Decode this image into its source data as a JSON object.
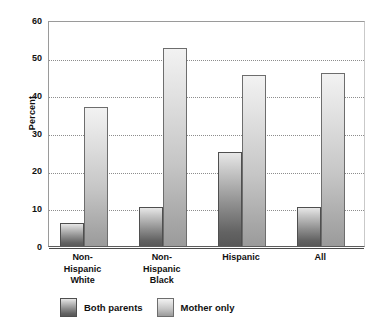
{
  "chart_data": {
    "type": "bar",
    "title": "",
    "subtitle": "",
    "xlabel": "",
    "ylabel": "Percent",
    "ylim": [
      0,
      60
    ],
    "yticks": [
      0,
      10,
      20,
      30,
      40,
      50,
      60
    ],
    "ytick_labels": [
      "0",
      "10",
      "20",
      "30",
      "40",
      "50",
      "60"
    ],
    "grid": true,
    "grid_axis": "y",
    "grid_style": "dotted",
    "legend_position": "bottom-left",
    "categories": [
      "Non-Hispanic White",
      "Non-Hispanic Black",
      "Hispanic",
      "All"
    ],
    "category_lines": [
      [
        "Non-",
        "Hispanic",
        "White"
      ],
      [
        "Non-",
        "Hispanic",
        "Black"
      ],
      [
        "Hispanic"
      ],
      [
        "All"
      ]
    ],
    "series": [
      {
        "name": "Both parents",
        "color": "#8f8f8f",
        "values": [
          6,
          10.3,
          25,
          10.3
        ]
      },
      {
        "name": "Mother only",
        "color": "#c6c6c6",
        "values": [
          37,
          52.5,
          45.5,
          46
        ]
      }
    ]
  },
  "legend": {
    "items": [
      {
        "label": "Both parents",
        "swatch": "both-parents-swatch"
      },
      {
        "label": "Mother only",
        "swatch": "mother-only-swatch"
      }
    ]
  }
}
